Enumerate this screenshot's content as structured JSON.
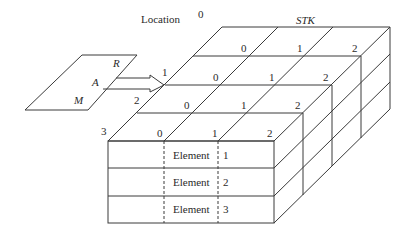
{
  "title_left": "Location",
  "title_right": "STK",
  "register": {
    "labels": [
      "R",
      "A",
      "M"
    ]
  },
  "location_labels": [
    "0",
    "1",
    "2",
    "3"
  ],
  "column_labels": [
    "0",
    "1",
    "2"
  ],
  "front_rows": [
    {
      "label": "Element",
      "index": "1"
    },
    {
      "label": "Element",
      "index": "2"
    },
    {
      "label": "Element",
      "index": "3"
    }
  ]
}
